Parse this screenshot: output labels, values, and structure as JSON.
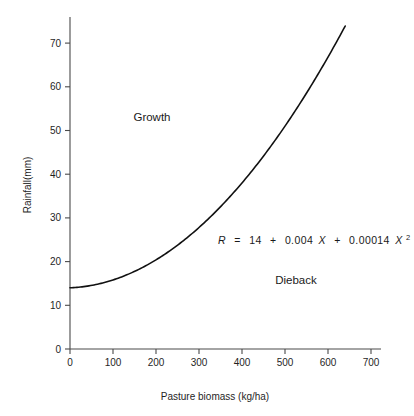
{
  "chart_data": {
    "type": "line",
    "title": "",
    "xlabel": "Pasture biomass (kg/ha)",
    "ylabel": "Rainfall(mm)",
    "xlim": [
      0,
      740
    ],
    "ylim": [
      0,
      75
    ],
    "xticks": [
      0,
      100,
      200,
      300,
      400,
      500,
      600,
      700
    ],
    "yticks": [
      0,
      10,
      20,
      30,
      40,
      50,
      60,
      70
    ],
    "grid": false,
    "legend": "none",
    "equation": "R = 14 + 0.004X + 0.00014X²",
    "equation_parts": {
      "response": "R",
      "equals": "=",
      "intercept": "14",
      "plus1": "+",
      "linear_coef": "0.004",
      "linear_var": "X",
      "plus2": "+",
      "quad_coef": "0.00014",
      "quad_var": "X",
      "quad_exponent": "2"
    },
    "annotations": [
      {
        "text": "Growth",
        "x": 180,
        "y": 52
      },
      {
        "text": "Dieback",
        "x": 470,
        "y": 18
      }
    ],
    "series": [
      {
        "name": "Rainfall threshold curve",
        "color": "#111111",
        "x": [
          0,
          40,
          80,
          120,
          160,
          200,
          240,
          280,
          320,
          360,
          400,
          440,
          480,
          520,
          560,
          600,
          640
        ],
        "values": [
          14.0,
          14.4,
          15.2,
          16.5,
          18.2,
          20.4,
          23.0,
          26.1,
          29.6,
          33.6,
          38.0,
          42.9,
          58.0,
          53.9,
          60.1,
          66.8,
          73.9
        ]
      }
    ]
  },
  "axis": {
    "x_tick_labels": [
      "0",
      "100",
      "200",
      "300",
      "400",
      "500",
      "600",
      "700"
    ],
    "y_tick_labels": [
      "0",
      "10",
      "20",
      "30",
      "40",
      "50",
      "60",
      "70"
    ],
    "x_title": "Pasture biomass (kg/ha)",
    "y_title": "Rainfall(mm)"
  },
  "labels": {
    "growth": "Growth",
    "dieback": "Dieback"
  }
}
